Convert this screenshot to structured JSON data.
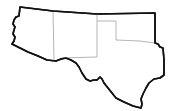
{
  "map": {
    "title": "",
    "region": "Southwest United States outline",
    "colors": {
      "background": "#ffffff",
      "outer_border": "#111111",
      "inner_border": "#b5b5b5"
    },
    "outline_path": "M20,7 L53,11 L97,14 L155,13 L155,43 L158,44 L160,47 L163,48 L164,60 L164,75 L160,78 L154,79 L149,83 L146,88 L143,94 L141,99 L142,104 L141,108 L133,106 L124,102 L116,98 L112,93 L108,88 L104,83 L102,79 L100,77 L97,80 L94,80 L90,81 L86,79 L82,73 L79,67 L76,63 L71,60 L66,58 L61,59 L56,61 L47,60 L38,56 L28,52 L20,48 L12,44 L14,41 L15,37 L13,34 L14,30 L15,27 L13,24 L14,20 L16,17 L19,16 L20,7 Z",
    "internal_borders": [
      {
        "name": "arizona-new-mexico-border",
        "path": "M53,11 L54,60"
      },
      {
        "name": "new-mexico-texas-border",
        "path": "M97,14 L97,57 L61,58"
      },
      {
        "name": "oklahoma-panhandle-border",
        "path": "M97,21 L116,21 L116,40 L140,41 L155,43"
      }
    ],
    "regions": [
      "Arizona",
      "New Mexico",
      "Oklahoma",
      "Texas"
    ]
  }
}
